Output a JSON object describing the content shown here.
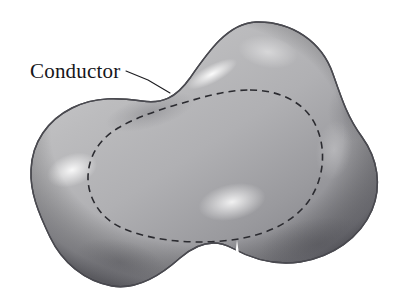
{
  "figure": {
    "background_color": "#ffffff",
    "labels": [
      {
        "id": "conductor",
        "text": "Conductor",
        "x": 30,
        "y": 78,
        "font_size": 21,
        "color": "#16161a"
      }
    ],
    "leader_line": {
      "name": "conductor-leader-line",
      "color": "#1c1c20",
      "width": 1.1,
      "points": "126,71 148,80 170,93"
    },
    "conductor_body": {
      "name": "conductor-blob",
      "outline_color": "#4a4a50",
      "outline_width": 1.4,
      "fill_light": "#f2f2f2",
      "fill_mid": "#a9a9ab",
      "fill_dark": "#6e6e72",
      "fill_edge": "#5a5a5e",
      "path": "M 256,22 C 292,21 322,42 333,74 C 342,100 348,118 362,137 C 378,159 382,186 372,210 C 360,238 332,257 300,262 C 272,266 250,258 232,248 C 214,238 196,244 180,258 C 160,276 136,290 112,286 C 84,281 62,262 50,237 C 38,212 30,192 31,170 C 32,142 48,120 72,108 C 96,96 120,98 142,101 C 162,104 176,98 190,78 C 208,52 228,23 256,22 Z"
    },
    "gaussian_surface": {
      "name": "gaussian-surface-dashed-contour",
      "stroke_color": "#2b2b30",
      "stroke_width": 1.6,
      "dash_pattern": "7 5",
      "path": "M 250,90 C 282,90 306,104 316,126 C 327,150 324,180 308,202 C 290,226 258,238 222,241 C 186,244 150,240 122,228 C 100,218 88,198 88,178 C 88,158 98,140 118,128 C 142,114 172,106 200,98 C 218,93 234,90 250,90 Z"
    },
    "highlights": [
      {
        "name": "highlight-upper-streak",
        "cx": 212,
        "cy": 74,
        "rx": 28,
        "ry": 9,
        "rotate": -28,
        "color": "#ffffff",
        "opacity": 0.95
      },
      {
        "name": "highlight-left-lobe",
        "cx": 72,
        "cy": 170,
        "rx": 26,
        "ry": 16,
        "rotate": -20,
        "color": "#ffffff",
        "opacity": 0.9
      },
      {
        "name": "highlight-lower-center",
        "cx": 232,
        "cy": 202,
        "rx": 34,
        "ry": 18,
        "rotate": -12,
        "color": "#ffffff",
        "opacity": 0.85
      },
      {
        "name": "highlight-top-dome",
        "cx": 268,
        "cy": 52,
        "rx": 30,
        "ry": 16,
        "rotate": 10,
        "color": "#ffffff",
        "opacity": 0.45
      },
      {
        "name": "highlight-right-lobe",
        "cx": 334,
        "cy": 150,
        "rx": 18,
        "ry": 30,
        "rotate": 8,
        "color": "#ffffff",
        "opacity": 0.25
      }
    ],
    "shadows": [
      {
        "name": "shadow-lower-right",
        "cx": 318,
        "cy": 244,
        "rx": 58,
        "ry": 26,
        "rotate": -8,
        "color": "#58585d",
        "opacity": 0.55
      },
      {
        "name": "shadow-lower-left",
        "cx": 120,
        "cy": 262,
        "rx": 46,
        "ry": 22,
        "rotate": 12,
        "color": "#5d5d62",
        "opacity": 0.5
      },
      {
        "name": "shadow-upper-left-neck",
        "cx": 150,
        "cy": 112,
        "rx": 46,
        "ry": 16,
        "rotate": -16,
        "color": "#6a6a6f",
        "opacity": 0.4
      },
      {
        "name": "shadow-right-waist",
        "cx": 350,
        "cy": 112,
        "rx": 22,
        "ry": 30,
        "rotate": 0,
        "color": "#64646a",
        "opacity": 0.4
      }
    ],
    "notch": {
      "name": "bottom-center-white-spike",
      "color": "#ffffff",
      "path": "M 237,240 L 243,282 L 250,307 L 224,307 L 232,282 Z"
    }
  }
}
